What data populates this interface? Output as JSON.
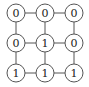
{
  "diagram": {
    "type": "grid-graph",
    "rows": 3,
    "cols": 3,
    "colors": {
      "stroke": "#555555",
      "text": "#222222",
      "background": "#ffffff"
    },
    "col_x": [
      16,
      45,
      74
    ],
    "row_y": [
      13,
      43,
      73
    ],
    "radius": 9,
    "values": [
      [
        "0",
        "0",
        "0"
      ],
      [
        "0",
        "1",
        "0"
      ],
      [
        "1",
        "1",
        "1"
      ]
    ]
  }
}
